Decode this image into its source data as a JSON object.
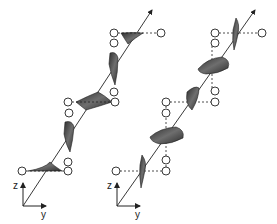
{
  "figure": {
    "panels": [
      {
        "id": "left",
        "description": "Wave polarization with alternating lobes (linear, in-plane)",
        "axes": {
          "z_label": "z",
          "y_label": "y"
        }
      },
      {
        "id": "right",
        "description": "Wave polarization with rotating lobes and dashed projection lines",
        "axes": {
          "z_label": "z",
          "y_label": "y"
        }
      }
    ],
    "colors": {
      "ink": "#222222",
      "lobe_dark": "#3a3a3a",
      "lobe_mid": "#6a6a6a",
      "node_fill": "#ffffff"
    }
  }
}
